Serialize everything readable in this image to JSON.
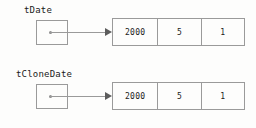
{
  "colors": {
    "background": "#fdfdfc",
    "border": "#9a9a9a",
    "text": "#1a1a1a",
    "arrow": "#5c5c5c"
  },
  "diagrams": [
    {
      "id": "original",
      "variable_label": "tDate",
      "pointer_box": {
        "value": ""
      },
      "record": {
        "fields": [
          {
            "value": "2000"
          },
          {
            "value": "5"
          },
          {
            "value": "1"
          }
        ]
      }
    },
    {
      "id": "clone",
      "variable_label": "tCloneDate",
      "pointer_box": {
        "value": ""
      },
      "record": {
        "fields": [
          {
            "value": "2000"
          },
          {
            "value": "5"
          },
          {
            "value": "1"
          }
        ]
      }
    }
  ]
}
